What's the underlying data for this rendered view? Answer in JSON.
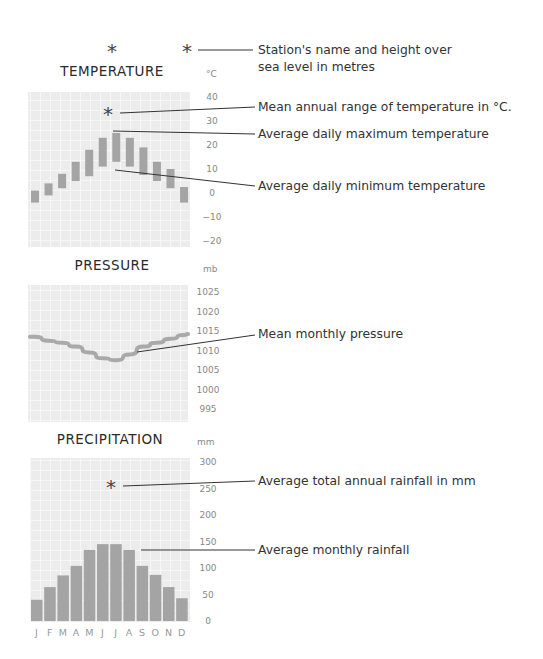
{
  "header": {
    "station_marker": "*",
    "height_marker": "*",
    "station_note": [
      "Station's name and height over",
      "sea level in metres"
    ]
  },
  "months": [
    "J",
    "F",
    "M",
    "A",
    "M",
    "J",
    "J",
    "A",
    "S",
    "O",
    "N",
    "D"
  ],
  "chart_data": [
    {
      "type": "bar",
      "title": "TEMPERATURE",
      "unit": "°C",
      "xlabel": "",
      "ylabel": "°C",
      "ylim": [
        -20,
        40
      ],
      "yticks": [
        40,
        30,
        20,
        10,
        0,
        -10,
        -20
      ],
      "categories": [
        "J",
        "F",
        "M",
        "A",
        "M",
        "J",
        "J",
        "A",
        "S",
        "O",
        "N",
        "D"
      ],
      "series": [
        {
          "name": "Average daily maximum temperature",
          "values": [
            1,
            4,
            8,
            13,
            18,
            23,
            25,
            23,
            19,
            13,
            10,
            2.5
          ]
        },
        {
          "name": "Average daily minimum temperature",
          "values": [
            -4,
            -1,
            2,
            5,
            7,
            11,
            13,
            11,
            7.5,
            5,
            2,
            -4
          ]
        }
      ],
      "annotations": {
        "range_marker": "*",
        "range_note": "Mean annual range of temperature in °C.",
        "max_note": "Average daily maximum temperature",
        "min_note": "Average daily minimum temperature"
      },
      "grid": true
    },
    {
      "type": "line",
      "title": "PRESSURE",
      "unit": "mb",
      "ylabel": "mb",
      "ylim": [
        993,
        1027
      ],
      "yticks": [
        1025,
        1020,
        1015,
        1010,
        1005,
        1000,
        995
      ],
      "categories": [
        "J",
        "F",
        "M",
        "A",
        "M",
        "J",
        "J",
        "A",
        "S",
        "O",
        "N",
        "D"
      ],
      "series": [
        {
          "name": "Mean monthly pressure",
          "values": [
            1013.5,
            1012.5,
            1012,
            1011,
            1009.5,
            1008,
            1007.5,
            1009,
            1011,
            1012,
            1013,
            1014
          ]
        }
      ],
      "annotations": {
        "line_note": "Mean monthly pressure"
      },
      "grid": true
    },
    {
      "type": "bar",
      "title": "PRECIPITATION",
      "unit": "mm",
      "ylabel": "mm",
      "ylim": [
        0,
        310
      ],
      "yticks": [
        300,
        250,
        200,
        150,
        100,
        50,
        0
      ],
      "categories": [
        "J",
        "F",
        "M",
        "A",
        "M",
        "J",
        "J",
        "A",
        "S",
        "O",
        "N",
        "D"
      ],
      "series": [
        {
          "name": "Average monthly rainfall",
          "values": [
            40,
            64,
            86,
            104,
            134,
            145,
            145,
            134,
            104,
            87,
            64,
            43
          ]
        }
      ],
      "annotations": {
        "total_marker": "*",
        "total_note": "Average total annual rainfall in mm",
        "bar_note": "Average monthly rainfall"
      },
      "grid": true
    }
  ],
  "colors": {
    "bar": "#a4a4a4",
    "line": "#a9a9a9",
    "grid_bg": "#ececec",
    "grid_line": "#f8f8f8",
    "text": "#333333",
    "tick": "#888888"
  }
}
